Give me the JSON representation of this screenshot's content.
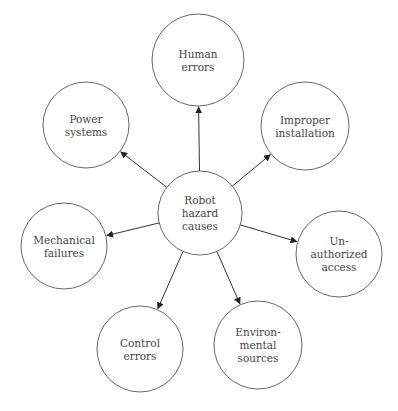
{
  "diagram": {
    "type": "radial-cause-map",
    "center": {
      "id": "robot-hazard-causes",
      "lines": [
        "Robot",
        "hazard",
        "causes"
      ],
      "cx": 200,
      "cy": 213,
      "r": 42
    },
    "nodes": [
      {
        "id": "human-errors",
        "lines": [
          "Human",
          "errors"
        ],
        "cx": 198,
        "cy": 60,
        "r": 46
      },
      {
        "id": "improper-installation",
        "lines": [
          "Improper",
          "installation"
        ],
        "cx": 305,
        "cy": 126,
        "r": 44
      },
      {
        "id": "unauthorized-access",
        "lines": [
          "Un-",
          "authorized",
          "access"
        ],
        "cx": 339,
        "cy": 254,
        "r": 43
      },
      {
        "id": "environmental-sources",
        "lines": [
          "Environ-",
          "mental",
          "sources"
        ],
        "cx": 258,
        "cy": 345,
        "r": 44
      },
      {
        "id": "control-errors",
        "lines": [
          "Control",
          "errors"
        ],
        "cx": 140,
        "cy": 349,
        "r": 43
      },
      {
        "id": "mechanical-failures",
        "lines": [
          "Mechanical",
          "failures"
        ],
        "cx": 64,
        "cy": 246,
        "r": 43
      },
      {
        "id": "power-systems",
        "lines": [
          "Power",
          "systems"
        ],
        "cx": 86,
        "cy": 125,
        "r": 43
      }
    ],
    "edges": [
      {
        "from": "robot-hazard-causes",
        "to": "human-errors"
      },
      {
        "from": "robot-hazard-causes",
        "to": "improper-installation"
      },
      {
        "from": "robot-hazard-causes",
        "to": "unauthorized-access"
      },
      {
        "from": "robot-hazard-causes",
        "to": "environmental-sources"
      },
      {
        "from": "robot-hazard-causes",
        "to": "control-errors"
      },
      {
        "from": "robot-hazard-causes",
        "to": "mechanical-failures"
      },
      {
        "from": "robot-hazard-causes",
        "to": "power-systems"
      }
    ],
    "colors": {
      "background": "#ffffff",
      "stroke": "#555555",
      "arrow": "#333333",
      "text": "#444444"
    }
  }
}
